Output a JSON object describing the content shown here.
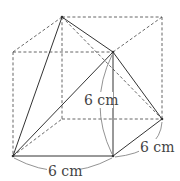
{
  "diagram": {
    "type": "geometry-figure",
    "labels": {
      "vertical_edge": "6 cm",
      "bottom_edge": "6 cm",
      "right_edge": "6 cm"
    },
    "colors": {
      "line": "#333333",
      "dashed": "#555555",
      "arc": "#777777",
      "text": "#444444",
      "background": "#ffffff"
    }
  }
}
